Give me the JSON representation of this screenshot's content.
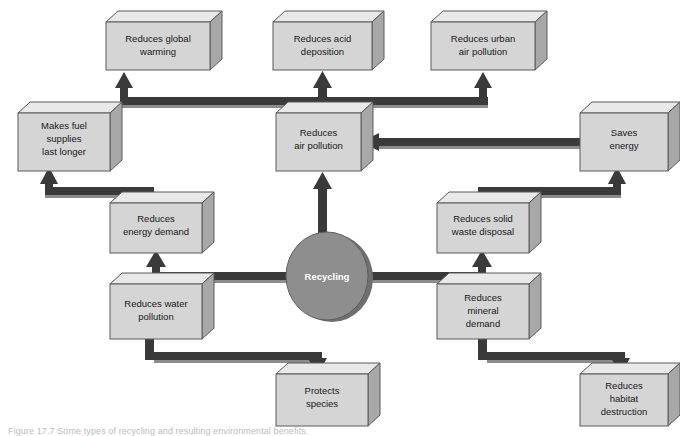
{
  "figure": {
    "hub": {
      "label": "Recycling",
      "shape": "ellipse",
      "cx": 327,
      "cy": 276,
      "rx": 41,
      "ry": 44
    },
    "caption": "Figure 17.7  Some types of recycling and resulting environmental benefits.",
    "colors": {
      "box_front": "#d5d5d5",
      "box_top": "#e9e9e9",
      "box_side": "#a8a8a8",
      "box_outline": "#5a5a5a",
      "hub_fill": "#8e8e8e",
      "hub_shadow": "#6f6f6f",
      "hub_text": "#ffffff",
      "connector": "#3a3a3a",
      "connector_shade": "#8c8c8c",
      "background": "#ffffff",
      "label_text": "#17181a"
    },
    "boxes": [
      {
        "id": "reduces-global-warming",
        "lines": [
          "Reduces global",
          "warming"
        ],
        "x": 106,
        "y": 22,
        "w": 104,
        "h": 48
      },
      {
        "id": "reduces-acid-deposition",
        "lines": [
          "Reduces acid",
          "deposition"
        ],
        "x": 273,
        "y": 22,
        "w": 99,
        "h": 48
      },
      {
        "id": "reduces-urban-air-pollution",
        "lines": [
          "Reduces urban",
          "air pollution"
        ],
        "x": 431,
        "y": 22,
        "w": 104,
        "h": 48
      },
      {
        "id": "makes-fuel-supplies-last-longer",
        "lines": [
          "Makes fuel",
          "supplies",
          "last longer"
        ],
        "x": 18,
        "y": 113,
        "w": 92,
        "h": 58
      },
      {
        "id": "reduces-air-pollution",
        "lines": [
          "Reduces",
          "air pollution"
        ],
        "x": 276,
        "y": 113,
        "w": 85,
        "h": 58
      },
      {
        "id": "saves-energy",
        "lines": [
          "Saves",
          "energy"
        ],
        "x": 580,
        "y": 113,
        "w": 98,
        "h": 58
      },
      {
        "id": "reduces-energy-demand",
        "lines": [
          "Reduces",
          "energy demand"
        ],
        "x": 110,
        "y": 203,
        "w": 92,
        "h": 50
      },
      {
        "id": "reduces-solid-waste-disposal",
        "lines": [
          "Reduces solid",
          "waste disposal"
        ],
        "x": 437,
        "y": 203,
        "w": 92,
        "h": 50
      },
      {
        "id": "reduces-water-pollution",
        "lines": [
          "Reduces water",
          "pollution"
        ],
        "x": 110,
        "y": 284,
        "w": 92,
        "h": 55
      },
      {
        "id": "reduces-mineral-demand",
        "lines": [
          "Reduces",
          "mineral",
          "demand"
        ],
        "x": 437,
        "y": 284,
        "w": 92,
        "h": 55
      },
      {
        "id": "protects-species",
        "lines": [
          "Protects",
          "species"
        ],
        "x": 276,
        "y": 374,
        "w": 92,
        "h": 52
      },
      {
        "id": "reduces-habitat-destruction",
        "lines": [
          "Reduces",
          "habitat",
          "destruction"
        ],
        "x": 580,
        "y": 374,
        "w": 94,
        "h": 52
      }
    ],
    "connections": [
      {
        "id": "air-pollution-to-global-warming",
        "from": "reduces-air-pollution",
        "to": "reduces-global-warming",
        "arrow": "single"
      },
      {
        "id": "air-pollution-to-acid-deposition",
        "from": "reduces-air-pollution",
        "to": "reduces-acid-deposition",
        "arrow": "single"
      },
      {
        "id": "air-pollution-to-urban-air-pollution",
        "from": "reduces-air-pollution",
        "to": "reduces-urban-air-pollution",
        "arrow": "single"
      },
      {
        "id": "saves-energy-to-air-pollution",
        "from": "saves-energy",
        "to": "reduces-air-pollution",
        "arrow": "single"
      },
      {
        "id": "recycling-to-air-pollution",
        "from": "Recycling",
        "to": "reduces-air-pollution",
        "arrow": "single"
      },
      {
        "id": "energy-demand-to-fuel-supplies",
        "from": "reduces-energy-demand",
        "to": "makes-fuel-supplies-last-longer",
        "arrow": "single"
      },
      {
        "id": "solid-waste-to-saves-energy",
        "from": "reduces-solid-waste-disposal",
        "to": "saves-energy",
        "arrow": "single"
      },
      {
        "id": "recycling-to-energy-and-water",
        "from": "Recycling",
        "to": "reduces-energy-demand / reduces-water-pollution",
        "arrow": "double"
      },
      {
        "id": "recycling-to-solid-waste-and-mineral",
        "from": "Recycling",
        "to": "reduces-solid-waste-disposal / reduces-mineral-demand",
        "arrow": "double"
      },
      {
        "id": "water-pollution-to-protects-species",
        "from": "reduces-water-pollution",
        "to": "protects-species",
        "arrow": "single"
      },
      {
        "id": "mineral-demand-to-habitat-destruction",
        "from": "reduces-mineral-demand",
        "to": "reduces-habitat-destruction",
        "arrow": "single"
      }
    ]
  }
}
